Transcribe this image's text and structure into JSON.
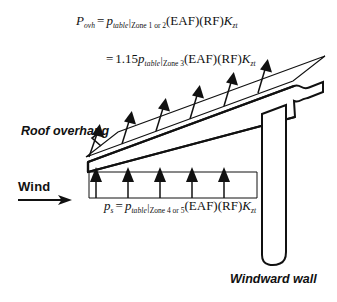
{
  "figure": {
    "background_color": "#ffffff",
    "line_color": "#111111"
  },
  "equations": {
    "overhang_line1": {
      "lhs_symbol": "P",
      "lhs_subscript": "ovh",
      "equals": "=",
      "rhs_symbol": "p",
      "rhs_subscript_italic": "table",
      "rhs_bar": "|",
      "rhs_subscript_zone": "Zone 1 or 2",
      "factors": "(EAF)(RF)",
      "k_symbol": "K",
      "k_subscript": "zt",
      "plain_text": "P_ovh = p_table|Zone 1 or 2 (EAF)(RF)K_zt"
    },
    "overhang_line2": {
      "equals": "=",
      "coefficient": "1.15",
      "rhs_symbol": "p",
      "rhs_subscript_italic": "table",
      "rhs_bar": "|",
      "rhs_subscript_zone": "Zone 3",
      "factors": "(EAF)(RF)",
      "k_symbol": "K",
      "k_subscript": "zt",
      "plain_text": "= 1.15 p_table|Zone 3 (EAF)(RF)K_zt"
    },
    "soffit": {
      "lhs_symbol": "p",
      "lhs_subscript": "s",
      "equals": "=",
      "rhs_symbol": "p",
      "rhs_subscript_italic": "table",
      "rhs_bar": "|",
      "rhs_subscript_zone": "Zone 4 or 5",
      "factors": "(EAF)(RF)",
      "k_symbol": "K",
      "k_subscript": "zt",
      "plain_text": "p_s = p_table|Zone 4 or 5 (EAF)(RF)K_zt"
    }
  },
  "labels": {
    "roof_overhang": "Roof overhang",
    "windward_wall": "Windward wall",
    "wind": "Wind"
  },
  "diagram": {
    "roof": {
      "description": "sloped roof slab rising left to right with broken right end",
      "upper_face": [
        [
          88,
          162
        ],
        [
          295,
          86
        ]
      ],
      "lower_face": [
        [
          88,
          162
        ],
        [
          295,
          117
        ]
      ],
      "break_side": "right"
    },
    "wall": {
      "description": "vertical windward wall with broken bottom end",
      "left_x": 262,
      "right_x": 286,
      "top_y": 112,
      "bottom_y": 266
    },
    "uplift_pressure": {
      "direction": "up",
      "arrow_count": 6,
      "envelope": "trapezoid parallel to roof slope, larger pressure toward ridge"
    },
    "soffit_pressure": {
      "direction": "up",
      "arrow_count": 5,
      "envelope": "uniform rectangle under the overhang soffit"
    },
    "wind_arrow": {
      "direction": "right",
      "from_x": 18,
      "to_x": 70,
      "y": 200
    },
    "leader_roof_overhang": {
      "from": [
        82,
        134
      ],
      "to": [
        101,
        146
      ]
    },
    "leader_windward_wall": {
      "from": [
        270,
        266
      ],
      "to": [
        270,
        270
      ]
    }
  }
}
